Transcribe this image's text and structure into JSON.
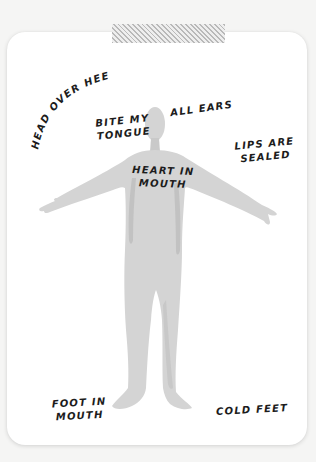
{
  "card": {
    "background_color": "#ffffff",
    "figure_color": "#d4d4d4",
    "figure_shade_color": "#bdbdbd",
    "text_color": "#1c1c1c"
  },
  "labels": {
    "head_over_heels": "HEAD OVER HEELS",
    "bite_my_tongue": [
      "BITE MY",
      "TONGUE"
    ],
    "all_ears": "ALL EARS",
    "lips_are_sealed": [
      "LIPS ARE",
      "SEALED"
    ],
    "heart_in_mouth": [
      "HEART IN",
      "MOUTH"
    ],
    "foot_in_mouth": [
      "FOOT IN",
      "MOUTH"
    ],
    "cold_feet": "COLD FEET"
  }
}
